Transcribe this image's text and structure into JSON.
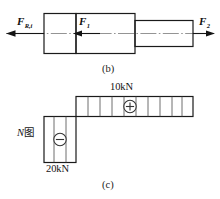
{
  "figure": {
    "panels": [
      {
        "id": "b",
        "caption": "(b)",
        "type": "free-body-diagram",
        "description": "Stepped shaft free body diagram with three axial forces",
        "forces": [
          {
            "name": "F-R-i",
            "base": "F",
            "subscript": "R,i",
            "direction": "left"
          },
          {
            "name": "F-1",
            "base": "F",
            "subscript": "1",
            "direction": "left"
          },
          {
            "name": "F-2",
            "base": "F",
            "subscript": "2",
            "direction": "right"
          }
        ]
      },
      {
        "id": "c",
        "caption": "(c)",
        "type": "axial-force-diagram",
        "diagram_label": "N图",
        "diagram_label_italic": "N",
        "diagram_label_rest": "图",
        "segments": [
          {
            "name": "tension-segment",
            "value": "10kN",
            "sign": "+",
            "sign_glyph": "⊕",
            "position": "upper-right"
          },
          {
            "name": "compression-segment",
            "value": "20kN",
            "sign": "−",
            "sign_glyph": "⊖",
            "position": "lower-left"
          }
        ]
      }
    ],
    "colors": {
      "stroke": "#1a1a1a",
      "hatch": "#4a4a4a",
      "centerline": "#555555",
      "background": "#ffffff"
    }
  }
}
